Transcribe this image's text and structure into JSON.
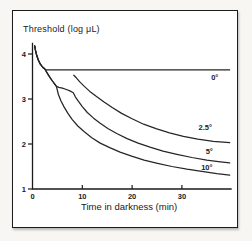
{
  "figure": {
    "y_axis_title": "Threshold (log μL)",
    "x_axis_label": "Time in darkness (min)"
  },
  "chart_data": {
    "type": "line",
    "xlabel": "Time in darkness (min)",
    "ylabel": "Threshold (log μL)",
    "xlim": [
      0,
      40
    ],
    "ylim": [
      1,
      4.25
    ],
    "x_ticks": [
      0,
      10,
      20,
      30
    ],
    "y_ticks": [
      1,
      2,
      3,
      4
    ],
    "grid": false,
    "legend_position": "inline-right",
    "line_color": "#262626",
    "axis_color": "#1a1a1a",
    "series": [
      {
        "name": "0°",
        "points": [
          [
            0.45,
            4.18
          ],
          [
            0.6,
            4.08
          ],
          [
            0.85,
            3.97
          ],
          [
            1.15,
            3.87
          ],
          [
            1.55,
            3.78
          ],
          [
            2.0,
            3.71
          ],
          [
            2.5,
            3.66
          ],
          [
            2.8,
            3.65
          ],
          [
            39.6,
            3.65
          ]
        ]
      },
      {
        "name": "2.5°",
        "points": [
          [
            8.3,
            3.53
          ],
          [
            8.8,
            3.47
          ],
          [
            9.5,
            3.38
          ],
          [
            10.4,
            3.28
          ],
          [
            11.5,
            3.17
          ],
          [
            12.8,
            3.06
          ],
          [
            14.3,
            2.94
          ],
          [
            16.0,
            2.81
          ],
          [
            17.9,
            2.68
          ],
          [
            20.0,
            2.56
          ],
          [
            22.3,
            2.44
          ],
          [
            24.8,
            2.34
          ],
          [
            27.5,
            2.25
          ],
          [
            30.3,
            2.17
          ],
          [
            33.2,
            2.11
          ],
          [
            36.3,
            2.06
          ],
          [
            39.6,
            2.03
          ]
        ]
      },
      {
        "name": "5°",
        "points": [
          [
            0.45,
            4.18
          ],
          [
            0.6,
            4.08
          ],
          [
            0.85,
            3.97
          ],
          [
            1.15,
            3.87
          ],
          [
            1.55,
            3.78
          ],
          [
            2.0,
            3.71
          ],
          [
            2.5,
            3.66
          ],
          [
            3.0,
            3.57
          ],
          [
            3.5,
            3.48
          ],
          [
            4.0,
            3.4
          ],
          [
            4.4,
            3.34
          ],
          [
            4.8,
            3.28
          ],
          [
            5.3,
            3.26
          ],
          [
            6.0,
            3.24
          ],
          [
            6.8,
            3.21
          ],
          [
            7.5,
            3.18
          ],
          [
            8.2,
            3.14
          ],
          [
            8.6,
            3.05
          ],
          [
            9.2,
            2.95
          ],
          [
            10.0,
            2.83
          ],
          [
            11.0,
            2.7
          ],
          [
            12.2,
            2.58
          ],
          [
            13.6,
            2.46
          ],
          [
            15.2,
            2.34
          ],
          [
            17.0,
            2.23
          ],
          [
            19.0,
            2.12
          ],
          [
            21.2,
            2.02
          ],
          [
            23.6,
            1.93
          ],
          [
            26.2,
            1.84
          ],
          [
            29.0,
            1.77
          ],
          [
            32.0,
            1.7
          ],
          [
            35.0,
            1.64
          ],
          [
            37.3,
            1.61
          ],
          [
            39.6,
            1.58
          ]
        ]
      },
      {
        "name": "10°",
        "points": [
          [
            0.45,
            4.18
          ],
          [
            0.6,
            4.08
          ],
          [
            0.85,
            3.97
          ],
          [
            1.15,
            3.87
          ],
          [
            1.55,
            3.78
          ],
          [
            2.0,
            3.71
          ],
          [
            2.5,
            3.66
          ],
          [
            3.0,
            3.57
          ],
          [
            3.5,
            3.48
          ],
          [
            4.0,
            3.4
          ],
          [
            4.4,
            3.34
          ],
          [
            4.8,
            3.28
          ],
          [
            5.2,
            3.1
          ],
          [
            5.7,
            2.96
          ],
          [
            6.3,
            2.83
          ],
          [
            7.1,
            2.68
          ],
          [
            8.0,
            2.54
          ],
          [
            9.1,
            2.4
          ],
          [
            10.4,
            2.27
          ],
          [
            11.9,
            2.14
          ],
          [
            13.6,
            2.02
          ],
          [
            15.5,
            1.92
          ],
          [
            17.6,
            1.82
          ],
          [
            19.9,
            1.73
          ],
          [
            22.4,
            1.64
          ],
          [
            25.1,
            1.57
          ],
          [
            28.0,
            1.5
          ],
          [
            31.0,
            1.44
          ],
          [
            34.0,
            1.39
          ],
          [
            37.0,
            1.34
          ],
          [
            39.6,
            1.31
          ]
        ]
      }
    ],
    "curve_labels": [
      {
        "text": "0°",
        "t": 36.6,
        "v": 3.47
      },
      {
        "text": "2.5°",
        "t": 34.7,
        "v": 2.37
      },
      {
        "text": "5°",
        "t": 35.5,
        "v": 1.83
      },
      {
        "text": "10°",
        "t": 35.0,
        "v": 1.47
      }
    ]
  }
}
